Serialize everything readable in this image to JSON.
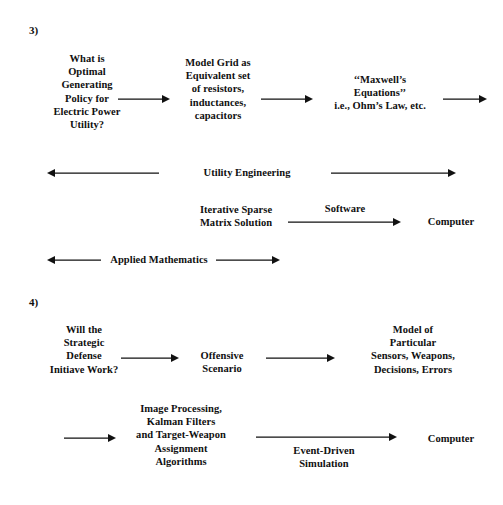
{
  "page": {
    "background": "#ffffff",
    "ink": "#111111",
    "width": 503,
    "height": 505
  },
  "sections": [
    {
      "number": "3)",
      "nodes": [
        {
          "name": "question-electric-power-utility",
          "text": "What is\nOptimal\nGenerating\nPolicy for\nElectric Power\nUtility?"
        },
        {
          "name": "model-grid-equivalent-circuit",
          "text": "Model Grid as\nEquivalent set\nof resistors,\ninductances,\ncapacitors"
        },
        {
          "name": "maxwells-equations",
          "text": "‘‘Maxwell’s\nEquations’’\ni.e., Ohm’s Law, etc."
        },
        {
          "name": "utility-engineering",
          "text": "Utility Engineering"
        },
        {
          "name": "iterative-sparse-matrix-solution",
          "text": "Iterative Sparse\nMatrix Solution"
        },
        {
          "name": "software",
          "text": "Software"
        },
        {
          "name": "computer-section-3",
          "text": "Computer"
        },
        {
          "name": "applied-mathematics",
          "text": "Applied Mathematics"
        }
      ]
    },
    {
      "number": "4)",
      "nodes": [
        {
          "name": "question-strategic-defense-initiative",
          "text": "Will the\nStrategic\nDefense\nInitiave Work?"
        },
        {
          "name": "offensive-scenario",
          "text": "Offensive\nScenario"
        },
        {
          "name": "model-of-particular-sensors",
          "text": "Model of\nParticular\nSensors, Weapons,\nDecisions, Errors"
        },
        {
          "name": "image-processing-algorithms",
          "text": "Image Processing,\nKalman Filters\nand Target-Weapon\nAssignment\nAlgorithms"
        },
        {
          "name": "event-driven-simulation",
          "text": "Event-Driven\nSimulation"
        },
        {
          "name": "computer-section-4",
          "text": "Computer"
        }
      ]
    }
  ],
  "arrows": [
    {
      "name": "arrow-question-to-model-grid",
      "direction": "right"
    },
    {
      "name": "arrow-model-grid-to-maxwell",
      "direction": "right"
    },
    {
      "name": "arrow-maxwell-to-offpage",
      "direction": "right"
    },
    {
      "name": "arrow-utility-engineering-left",
      "direction": "left"
    },
    {
      "name": "arrow-utility-engineering-right",
      "direction": "right"
    },
    {
      "name": "arrow-software-to-computer",
      "direction": "right"
    },
    {
      "name": "arrow-applied-math-left",
      "direction": "left"
    },
    {
      "name": "arrow-applied-math-right",
      "direction": "right"
    },
    {
      "name": "arrow-sdi-to-offensive-scenario",
      "direction": "right"
    },
    {
      "name": "arrow-offensive-scenario-to-model",
      "direction": "right"
    },
    {
      "name": "arrow-into-image-processing",
      "direction": "right"
    },
    {
      "name": "arrow-simulation-to-computer",
      "direction": "right"
    }
  ]
}
